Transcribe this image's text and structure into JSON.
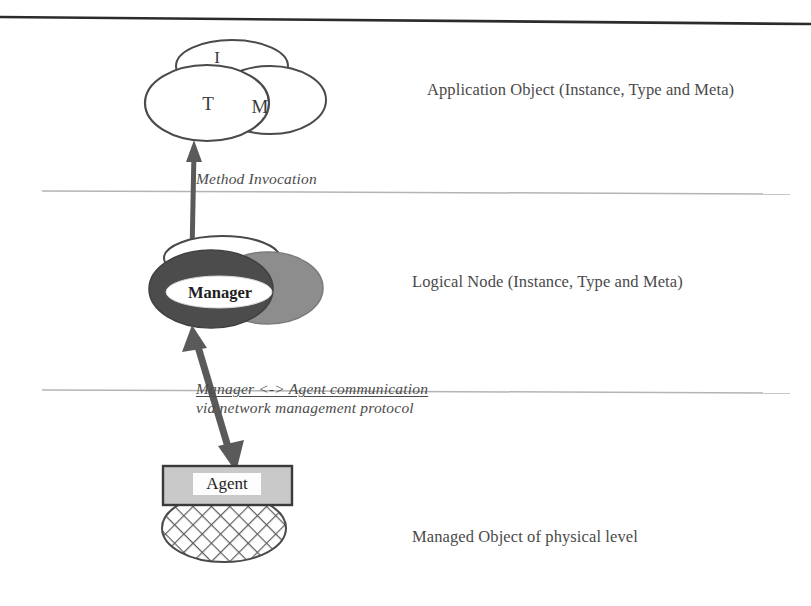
{
  "figure": {
    "kind": "layered-architecture-diagram",
    "background_color": "#ffffff",
    "ink_color": "#3a3a3a"
  },
  "tiers": [
    {
      "id": "application",
      "caption": "Application Object (Instance, Type and Meta)",
      "nodes": [
        {
          "id": "instance",
          "label": "I",
          "style": "outline"
        },
        {
          "id": "type",
          "label": "T",
          "style": "outline"
        },
        {
          "id": "meta",
          "label": "M",
          "style": "outline"
        }
      ]
    },
    {
      "id": "logical",
      "caption": "Logical Node (Instance, Type and Meta)",
      "nodes": [
        {
          "id": "logical-back",
          "label": "",
          "style": "outline"
        },
        {
          "id": "logical-dark",
          "label": "",
          "style": "filled-dark"
        },
        {
          "id": "logical-mid",
          "label": "",
          "style": "filled-gray"
        },
        {
          "id": "manager",
          "label": "Manager",
          "style": "filled-white"
        }
      ]
    },
    {
      "id": "managed",
      "caption": "Managed Object of physical level",
      "nodes": [
        {
          "id": "agent",
          "label": "Agent",
          "style": "gray-box"
        },
        {
          "id": "physical",
          "label": "",
          "style": "crosshatch-ellipse"
        }
      ]
    }
  ],
  "connections": [
    {
      "id": "method-invocation",
      "annotation": "Method Invocation",
      "from": "logical",
      "to": "application",
      "arrow": "double-headed"
    },
    {
      "id": "manager-agent",
      "annotation_line1": "Manager <-> Agent communication",
      "annotation_line2": "via network management protocol",
      "from": "managed",
      "to": "logical",
      "arrow": "double-headed"
    }
  ],
  "colors": {
    "outline": "#4a4a4a",
    "fill_dark": "#4c4c4c",
    "fill_gray": "#8d8d8d",
    "fill_white": "#ffffff",
    "box_fill": "#c9c9c9",
    "divider": "#b4b4b4",
    "arrow": "#5a5a5a",
    "scan_rule": "#2b2b2b"
  }
}
